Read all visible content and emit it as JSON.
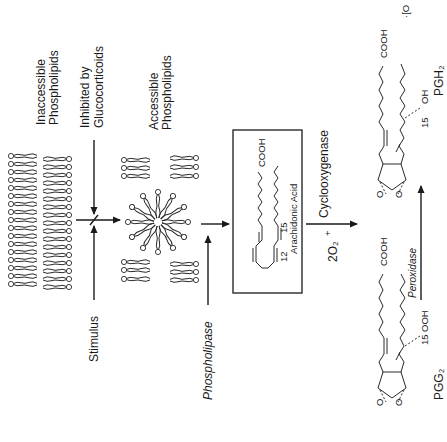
{
  "diagram": {
    "orientation": "rotated 90 degrees counter-clockwise",
    "labels": {
      "inaccessible_1": "Inaccessible",
      "inaccessible_2": "Phospholipids",
      "inhibited_1": "Inhibited by",
      "inhibited_2": "Glucocorticoids",
      "accessible_1": "Accessible",
      "accessible_2": "Phospholipids",
      "stimulus": "Stimulus",
      "phospholipase": "Phospholipase",
      "arachidonic_acid": "Arachidonic Acid",
      "aa_cooh": "COOH",
      "aa_c12": "12",
      "aa_c15": "15",
      "cyclooxygenase": "Cyclooxygenase",
      "oxygen": "2O₂",
      "oxygen_sup": "+",
      "peroxidase": "Peroxidase",
      "pgg2": "PGG₂",
      "pgg2_cooh": "COOH",
      "pgg2_ooh": "OOH",
      "pgg2_c15": "15",
      "pgh2": "PGH₂",
      "pgh2_cooh": "COOH",
      "pgh2_oh": "OH",
      "pgh2_c15": "15",
      "pgh2_extra": "·[O",
      "o": "O"
    },
    "nodes": [
      {
        "id": "inaccessible",
        "label": "Inaccessible Phospholipids"
      },
      {
        "id": "accessible",
        "label": "Accessible Phospholipids"
      },
      {
        "id": "aa",
        "label": "Arachidonic Acid"
      },
      {
        "id": "pgg2",
        "label": "PGG2"
      },
      {
        "id": "pgh2",
        "label": "PGH2"
      }
    ],
    "edges": [
      {
        "from": "inaccessible",
        "to": "accessible",
        "via": "Stimulus",
        "inhibitor": "Glucocorticoids"
      },
      {
        "from": "accessible",
        "to": "aa",
        "enzyme": "Phospholipase"
      },
      {
        "from": "aa",
        "to": "pgg2",
        "enzyme": "Cyclooxygenase",
        "cofactor": "2O2"
      },
      {
        "from": "pgg2",
        "to": "pgh2",
        "enzyme": "Peroxidase"
      }
    ]
  }
}
